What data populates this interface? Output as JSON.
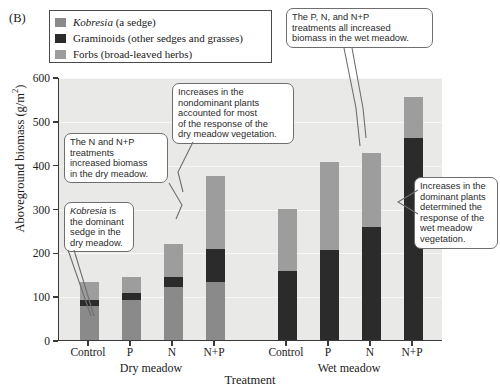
{
  "panel": {
    "label": "(B)"
  },
  "legend": {
    "items": [
      {
        "name": "Kobresia",
        "italic_part": "Kobresia",
        "rest": " (a sedge)",
        "color": "#8a8a8a"
      },
      {
        "name": "Graminoids",
        "italic_part": "",
        "rest": "Graminoids (other sedges and grasses)",
        "color": "#2b2b2b"
      },
      {
        "name": "Forbs",
        "italic_part": "",
        "rest": "Forbs (broad-leaved herbs)",
        "color": "#9d9d9d"
      }
    ]
  },
  "axes": {
    "y_title_main": "Aboveground biomass (g/m",
    "y_title_sup": "2",
    "y_title_end": ")",
    "y_ticks": [
      "0",
      "100",
      "200",
      "300",
      "400",
      "500",
      "600"
    ],
    "x_title": "Treatment",
    "x_ticks": [
      "Control",
      "P",
      "N",
      "N+P",
      "Control",
      "P",
      "N",
      "N+P"
    ],
    "group_labels": [
      "Dry meadow",
      "Wet meadow"
    ]
  },
  "callouts": [
    {
      "id": "dry-n-np",
      "lines": [
        "The N and N+P",
        "treatments",
        "increased biomass",
        "in the dry meadow."
      ]
    },
    {
      "id": "kobresia-dominant",
      "lines": [
        "Kobresia is",
        "the dominant",
        "sedge in the",
        "dry meadow."
      ],
      "first_line_italic_word": "Kobresia"
    },
    {
      "id": "nondominant",
      "lines": [
        "Increases in the",
        "nondominant plants",
        "accounted for most",
        "of the response of the",
        "dry meadow vegetation."
      ]
    },
    {
      "id": "wet-all-increased",
      "lines": [
        "The P, N, and N+P",
        "treatments all increased",
        "biomass in the wet meadow."
      ]
    },
    {
      "id": "dominant-wet",
      "lines": [
        "Increases in the",
        "dominant plants",
        "determined the",
        "response of the",
        "wet meadow",
        "vegetation."
      ]
    }
  ],
  "chart_data": {
    "type": "bar",
    "subtype": "stacked",
    "title": "",
    "xlabel": "Treatment",
    "ylabel": "Aboveground biomass (g/m2)",
    "ylim": [
      0,
      600
    ],
    "yticks": [
      0,
      100,
      200,
      300,
      400,
      500,
      600
    ],
    "grid": true,
    "legend_position": "top-left",
    "groups": [
      "Dry meadow",
      "Wet meadow"
    ],
    "categories": [
      "Control",
      "P",
      "N",
      "N+P",
      "Control",
      "P",
      "N",
      "N+P"
    ],
    "series": [
      {
        "name": "Kobresia (a sedge)",
        "color": "#8a8a8a",
        "values": [
          78,
          92,
          122,
          132,
          0,
          0,
          0,
          0
        ]
      },
      {
        "name": "Graminoids (other sedges and grasses)",
        "color": "#2b2b2b",
        "values": [
          14,
          16,
          22,
          75,
          158,
          205,
          258,
          462
        ]
      },
      {
        "name": "Forbs (broad-leaved herbs)",
        "color": "#9d9d9d",
        "values": [
          40,
          36,
          76,
          168,
          142,
          202,
          168,
          93
        ]
      }
    ],
    "totals": [
      132,
      144,
      220,
      375,
      300,
      407,
      426,
      555
    ]
  }
}
